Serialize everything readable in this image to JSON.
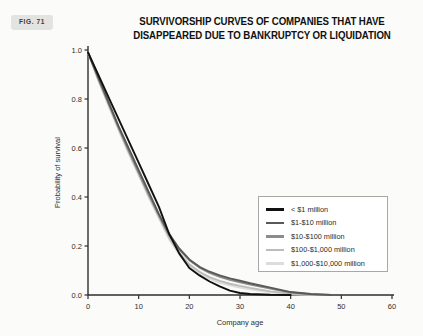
{
  "figure": {
    "badge": "FIG. 71"
  },
  "chart_data": {
    "type": "line",
    "title": "SURVIVORSHIP CURVES OF COMPANIES THAT HAVE DISAPPEARED DUE TO BANKRUPTCY OR LIQUIDATION",
    "title_lines": [
      "SURVIVORSHIP CURVES OF COMPANIES THAT HAVE",
      "DISAPPEARED DUE TO BANKRUPTCY OR LIQUIDATION"
    ],
    "xlabel": "Company age",
    "ylabel": "Probability of survival",
    "xlim": [
      0,
      60
    ],
    "ylim": [
      0.0,
      1.0
    ],
    "xticks": [
      0,
      10,
      20,
      30,
      40,
      50,
      60
    ],
    "xtick_labels": [
      "0",
      "10",
      "20",
      "30",
      "40",
      "50",
      "60"
    ],
    "yticks": [
      0.0,
      0.2,
      0.4,
      0.6,
      0.8,
      1.0
    ],
    "ytick_labels": [
      "0.0",
      "0.2",
      "0.4",
      "0.6",
      "0.8",
      "1.0"
    ],
    "grid": false,
    "legend_position": "center-right",
    "series": [
      {
        "name": "< $1 million",
        "color": "#111111",
        "x": [
          0,
          2,
          4,
          6,
          8,
          10,
          12,
          14,
          16,
          18,
          20,
          22,
          24,
          26,
          28,
          30,
          32,
          36,
          40
        ],
        "y": [
          0.99,
          0.9,
          0.81,
          0.72,
          0.63,
          0.54,
          0.45,
          0.36,
          0.25,
          0.17,
          0.11,
          0.08,
          0.055,
          0.035,
          0.018,
          0.008,
          0.004,
          0.001,
          0.0
        ]
      },
      {
        "name": "$1-$10 million",
        "color": "#595957",
        "x": [
          0,
          2,
          4,
          6,
          8,
          10,
          12,
          14,
          16,
          18,
          20,
          22,
          24,
          26,
          28,
          30,
          32,
          36,
          40,
          44,
          48
        ],
        "y": [
          0.99,
          0.89,
          0.79,
          0.69,
          0.6,
          0.51,
          0.42,
          0.33,
          0.25,
          0.19,
          0.145,
          0.115,
          0.095,
          0.08,
          0.068,
          0.058,
          0.048,
          0.03,
          0.012,
          0.004,
          0.0
        ]
      },
      {
        "name": "$10-$100 million",
        "color": "#8c8c8a",
        "x": [
          0,
          2,
          4,
          6,
          8,
          10,
          12,
          14,
          16,
          18,
          20,
          22,
          24,
          26,
          28,
          30,
          32,
          36,
          40,
          44,
          48
        ],
        "y": [
          0.99,
          0.885,
          0.785,
          0.685,
          0.59,
          0.5,
          0.41,
          0.325,
          0.245,
          0.185,
          0.142,
          0.112,
          0.09,
          0.074,
          0.062,
          0.052,
          0.043,
          0.026,
          0.01,
          0.003,
          0.0
        ]
      },
      {
        "name": "$100-$1,000 million",
        "color": "#bcbcba",
        "x": [
          0,
          2,
          4,
          6,
          8,
          10,
          12,
          14,
          16,
          18,
          20,
          22,
          24,
          26,
          28,
          30,
          32,
          36,
          40,
          44,
          48
        ],
        "y": [
          0.99,
          0.88,
          0.78,
          0.68,
          0.585,
          0.495,
          0.405,
          0.32,
          0.235,
          0.172,
          0.125,
          0.095,
          0.073,
          0.058,
          0.046,
          0.037,
          0.029,
          0.015,
          0.005,
          0.001,
          0.0
        ]
      },
      {
        "name": "$1,000-$10,000 million",
        "color": "#dcdcda",
        "x": [
          0,
          2,
          4,
          6,
          8,
          10,
          12,
          14,
          16,
          18,
          20,
          22,
          24,
          26,
          28,
          30,
          32,
          36,
          40,
          44,
          48
        ],
        "y": [
          0.99,
          0.878,
          0.775,
          0.675,
          0.578,
          0.488,
          0.398,
          0.313,
          0.228,
          0.165,
          0.118,
          0.088,
          0.066,
          0.05,
          0.039,
          0.03,
          0.023,
          0.011,
          0.003,
          0.0005,
          0.0
        ]
      }
    ]
  },
  "legend": {
    "items": [
      {
        "label": "< $1 million",
        "color": "#111111"
      },
      {
        "label": "$1-$10 million",
        "color": "#595957"
      },
      {
        "label": "$10-$100 million",
        "color": "#8c8c8a"
      },
      {
        "label": "$100-$1,000 million",
        "color": "#bcbcba"
      },
      {
        "label": "$1,000-$10,000 million",
        "color": "#dcdcda"
      }
    ]
  },
  "colors": {
    "background": "#fbfbfa",
    "axis": "#2e2e2c",
    "legend_border": "#a8a8a6",
    "badge_background": "#e3e3e1"
  }
}
